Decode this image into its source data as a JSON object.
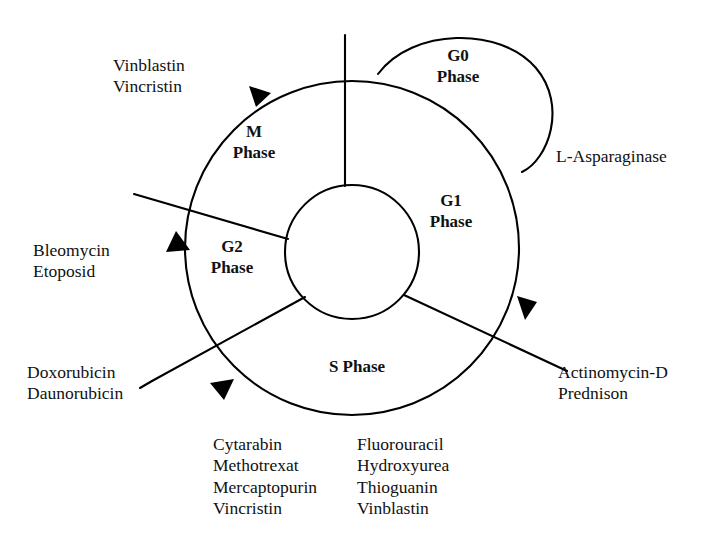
{
  "diagram": {
    "stroke_color": "#000000",
    "text_color": "#111111",
    "background": "#ffffff",
    "phases": [
      {
        "id": "g0",
        "name_line1": "G0",
        "name_line2": "Phase"
      },
      {
        "id": "m",
        "name_line1": "M",
        "name_line2": "Phase"
      },
      {
        "id": "g1",
        "name_line1": "G1",
        "name_line2": "Phase"
      },
      {
        "id": "g2",
        "name_line1": "G2",
        "name_line2": "Phase"
      },
      {
        "id": "s",
        "name_line1": "S Phase",
        "name_line2": ""
      }
    ],
    "drug_labels": [
      {
        "id": "m-phase-drugs",
        "position": "top-left",
        "lines": [
          "Vinblastin",
          "Vincristin"
        ]
      },
      {
        "id": "g0-phase-drugs",
        "position": "right",
        "lines": [
          "L-Asparaginase"
        ]
      },
      {
        "id": "g2-phase-drugs",
        "position": "left",
        "lines": [
          "Bleomycin",
          "Etoposid"
        ]
      },
      {
        "id": "g2s-boundary-drugs",
        "position": "bottom-left",
        "lines": [
          "Doxorubicin",
          "Daunorubicin"
        ]
      },
      {
        "id": "g1-phase-drugs",
        "position": "bottom-right",
        "lines": [
          "Actinomycin-D",
          "Prednison"
        ]
      },
      {
        "id": "s-phase-drugs-column-1",
        "position": "bottom-center-left",
        "lines": [
          "Cytarabin",
          "Methotrexat",
          "Mercaptopurin",
          "Vincristin"
        ]
      },
      {
        "id": "s-phase-drugs-column-2",
        "position": "bottom-center-right",
        "lines": [
          "Fluorouracil",
          "Hydroxyurea",
          "Thioguanin",
          "Vinblastin"
        ]
      }
    ]
  }
}
